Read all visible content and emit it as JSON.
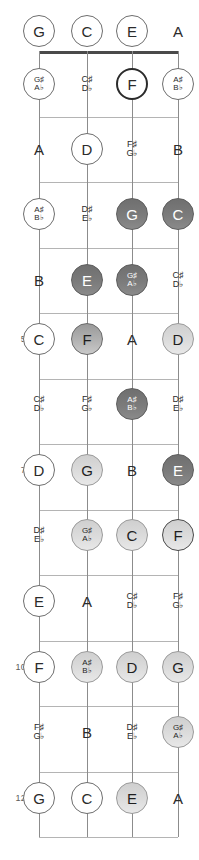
{
  "diagram": {
    "type": "bass-guitar-fretboard",
    "title": "",
    "orientation": "vertical",
    "string_count": 4,
    "fret_count": 12,
    "string_names": [
      "G",
      "C",
      "E",
      "A"
    ],
    "string_x": [
      39,
      87,
      132,
      178
    ],
    "nut_y": 51,
    "fret_spacing": 65.5,
    "fret_numbers_shown": [
      "5",
      "7",
      "10",
      "12"
    ],
    "colors": {
      "nut": "#4a4a4a",
      "fret_wire": "#b4b4b4",
      "string": "#8c8c8c",
      "ring_outline": "#6e6e6e",
      "fill_dark": "#7b7b7b",
      "fill_mid": "#b2b2b2",
      "fill_light": "#dcdcdc",
      "text_dark": "#2b2b2b",
      "text_light": "#ffffff",
      "fret_number": "#5a5a5a"
    }
  },
  "fret_labels": [
    {
      "fret": 5,
      "label": "5",
      "y": 339
    },
    {
      "fret": 7,
      "label": "7",
      "y": 470
    },
    {
      "fret": 10,
      "label": "10",
      "y": 667
    },
    {
      "fret": 12,
      "label": "12",
      "y": 798
    }
  ],
  "notes": [
    {
      "fret": 0,
      "string": 0,
      "x": 39,
      "y": 31,
      "natural": "G",
      "acc_top": "",
      "acc_bot": "",
      "style": "ring"
    },
    {
      "fret": 0,
      "string": 1,
      "x": 87,
      "y": 31,
      "natural": "C",
      "acc_top": "",
      "acc_bot": "",
      "style": "ring"
    },
    {
      "fret": 0,
      "string": 2,
      "x": 132,
      "y": 31,
      "natural": "E",
      "acc_top": "",
      "acc_bot": "",
      "style": "ring"
    },
    {
      "fret": 0,
      "string": 3,
      "x": 178,
      "y": 31,
      "natural": "A",
      "acc_top": "",
      "acc_bot": "",
      "style": "plain"
    },
    {
      "fret": 1,
      "string": 0,
      "x": 39,
      "y": 84,
      "natural": "",
      "acc_top": "G♯",
      "acc_bot": "A♭",
      "style": "ring"
    },
    {
      "fret": 1,
      "string": 1,
      "x": 87,
      "y": 84,
      "natural": "",
      "acc_top": "C♯",
      "acc_bot": "D♭",
      "style": "plain"
    },
    {
      "fret": 1,
      "string": 2,
      "x": 132,
      "y": 84,
      "natural": "F",
      "acc_top": "",
      "acc_bot": "",
      "style": "ring-thick"
    },
    {
      "fret": 1,
      "string": 3,
      "x": 178,
      "y": 84,
      "natural": "",
      "acc_top": "A♯",
      "acc_bot": "B♭",
      "style": "ring"
    },
    {
      "fret": 2,
      "string": 0,
      "x": 39,
      "y": 149,
      "natural": "A",
      "acc_top": "",
      "acc_bot": "",
      "style": "plain"
    },
    {
      "fret": 2,
      "string": 1,
      "x": 87,
      "y": 149,
      "natural": "D",
      "acc_top": "",
      "acc_bot": "",
      "style": "ring"
    },
    {
      "fret": 2,
      "string": 2,
      "x": 132,
      "y": 149,
      "natural": "",
      "acc_top": "F♯",
      "acc_bot": "G♭",
      "style": "plain"
    },
    {
      "fret": 2,
      "string": 3,
      "x": 178,
      "y": 149,
      "natural": "B",
      "acc_top": "",
      "acc_bot": "",
      "style": "plain"
    },
    {
      "fret": 3,
      "string": 0,
      "x": 39,
      "y": 214,
      "natural": "",
      "acc_top": "A♯",
      "acc_bot": "B♭",
      "style": "ring"
    },
    {
      "fret": 3,
      "string": 1,
      "x": 87,
      "y": 214,
      "natural": "",
      "acc_top": "D♯",
      "acc_bot": "E♭",
      "style": "plain"
    },
    {
      "fret": 3,
      "string": 2,
      "x": 132,
      "y": 214,
      "natural": "G",
      "acc_top": "",
      "acc_bot": "",
      "style": "fill-dark"
    },
    {
      "fret": 3,
      "string": 3,
      "x": 178,
      "y": 214,
      "natural": "C",
      "acc_top": "",
      "acc_bot": "",
      "style": "fill-dark"
    },
    {
      "fret": 4,
      "string": 0,
      "x": 39,
      "y": 280,
      "natural": "B",
      "acc_top": "",
      "acc_bot": "",
      "style": "plain"
    },
    {
      "fret": 4,
      "string": 1,
      "x": 87,
      "y": 280,
      "natural": "E",
      "acc_top": "",
      "acc_bot": "",
      "style": "fill-dark"
    },
    {
      "fret": 4,
      "string": 2,
      "x": 132,
      "y": 280,
      "natural": "",
      "acc_top": "G♯",
      "acc_bot": "A♭",
      "style": "fill-dark"
    },
    {
      "fret": 4,
      "string": 3,
      "x": 178,
      "y": 280,
      "natural": "",
      "acc_top": "C♯",
      "acc_bot": "D♭",
      "style": "plain"
    },
    {
      "fret": 5,
      "string": 0,
      "x": 39,
      "y": 339,
      "natural": "C",
      "acc_top": "",
      "acc_bot": "",
      "style": "ring"
    },
    {
      "fret": 5,
      "string": 1,
      "x": 87,
      "y": 339,
      "natural": "F",
      "acc_top": "",
      "acc_bot": "",
      "style": "fill-mid"
    },
    {
      "fret": 5,
      "string": 2,
      "x": 132,
      "y": 339,
      "natural": "A",
      "acc_top": "",
      "acc_bot": "",
      "style": "plain"
    },
    {
      "fret": 5,
      "string": 3,
      "x": 178,
      "y": 339,
      "natural": "D",
      "acc_top": "",
      "acc_bot": "",
      "style": "fill-light"
    },
    {
      "fret": 6,
      "string": 0,
      "x": 39,
      "y": 404,
      "natural": "",
      "acc_top": "C♯",
      "acc_bot": "D♭",
      "style": "plain"
    },
    {
      "fret": 6,
      "string": 1,
      "x": 87,
      "y": 404,
      "natural": "",
      "acc_top": "F♯",
      "acc_bot": "G♭",
      "style": "plain"
    },
    {
      "fret": 6,
      "string": 2,
      "x": 132,
      "y": 404,
      "natural": "",
      "acc_top": "A♯",
      "acc_bot": "B♭",
      "style": "fill-dark"
    },
    {
      "fret": 6,
      "string": 3,
      "x": 178,
      "y": 404,
      "natural": "",
      "acc_top": "D♯",
      "acc_bot": "E♭",
      "style": "plain"
    },
    {
      "fret": 7,
      "string": 0,
      "x": 39,
      "y": 470,
      "natural": "D",
      "acc_top": "",
      "acc_bot": "",
      "style": "ring"
    },
    {
      "fret": 7,
      "string": 1,
      "x": 87,
      "y": 470,
      "natural": "G",
      "acc_top": "",
      "acc_bot": "",
      "style": "fill-light"
    },
    {
      "fret": 7,
      "string": 2,
      "x": 132,
      "y": 470,
      "natural": "B",
      "acc_top": "",
      "acc_bot": "",
      "style": "plain"
    },
    {
      "fret": 7,
      "string": 3,
      "x": 178,
      "y": 470,
      "natural": "E",
      "acc_top": "",
      "acc_bot": "",
      "style": "fill-dark"
    },
    {
      "fret": 8,
      "string": 0,
      "x": 39,
      "y": 535,
      "natural": "",
      "acc_top": "D♯",
      "acc_bot": "E♭",
      "style": "plain"
    },
    {
      "fret": 8,
      "string": 1,
      "x": 87,
      "y": 535,
      "natural": "",
      "acc_top": "G♯",
      "acc_bot": "A♭",
      "style": "fill-light"
    },
    {
      "fret": 8,
      "string": 2,
      "x": 132,
      "y": 535,
      "natural": "C",
      "acc_top": "",
      "acc_bot": "",
      "style": "fill-light"
    },
    {
      "fret": 8,
      "string": 3,
      "x": 178,
      "y": 535,
      "natural": "F",
      "acc_top": "",
      "acc_bot": "",
      "style": "fill-light-ringed"
    },
    {
      "fret": 9,
      "string": 0,
      "x": 39,
      "y": 601,
      "natural": "E",
      "acc_top": "",
      "acc_bot": "",
      "style": "ring"
    },
    {
      "fret": 9,
      "string": 1,
      "x": 87,
      "y": 601,
      "natural": "A",
      "acc_top": "",
      "acc_bot": "",
      "style": "plain"
    },
    {
      "fret": 9,
      "string": 2,
      "x": 132,
      "y": 601,
      "natural": "",
      "acc_top": "C♯",
      "acc_bot": "D♭",
      "style": "plain"
    },
    {
      "fret": 9,
      "string": 3,
      "x": 178,
      "y": 601,
      "natural": "",
      "acc_top": "F♯",
      "acc_bot": "G♭",
      "style": "plain"
    },
    {
      "fret": 10,
      "string": 0,
      "x": 39,
      "y": 667,
      "natural": "F",
      "acc_top": "",
      "acc_bot": "",
      "style": "ring"
    },
    {
      "fret": 10,
      "string": 1,
      "x": 87,
      "y": 667,
      "natural": "",
      "acc_top": "A♯",
      "acc_bot": "B♭",
      "style": "fill-light"
    },
    {
      "fret": 10,
      "string": 2,
      "x": 132,
      "y": 667,
      "natural": "D",
      "acc_top": "",
      "acc_bot": "",
      "style": "fill-light"
    },
    {
      "fret": 10,
      "string": 3,
      "x": 178,
      "y": 667,
      "natural": "G",
      "acc_top": "",
      "acc_bot": "",
      "style": "fill-light"
    },
    {
      "fret": 11,
      "string": 0,
      "x": 39,
      "y": 732,
      "natural": "",
      "acc_top": "F♯",
      "acc_bot": "G♭",
      "style": "plain"
    },
    {
      "fret": 11,
      "string": 1,
      "x": 87,
      "y": 732,
      "natural": "B",
      "acc_top": "",
      "acc_bot": "",
      "style": "plain"
    },
    {
      "fret": 11,
      "string": 2,
      "x": 132,
      "y": 732,
      "natural": "",
      "acc_top": "D♯",
      "acc_bot": "E♭",
      "style": "plain"
    },
    {
      "fret": 11,
      "string": 3,
      "x": 178,
      "y": 732,
      "natural": "",
      "acc_top": "G♯",
      "acc_bot": "A♭",
      "style": "fill-light"
    },
    {
      "fret": 12,
      "string": 0,
      "x": 39,
      "y": 798,
      "natural": "G",
      "acc_top": "",
      "acc_bot": "",
      "style": "ring"
    },
    {
      "fret": 12,
      "string": 1,
      "x": 87,
      "y": 798,
      "natural": "C",
      "acc_top": "",
      "acc_bot": "",
      "style": "ring"
    },
    {
      "fret": 12,
      "string": 2,
      "x": 132,
      "y": 798,
      "natural": "E",
      "acc_top": "",
      "acc_bot": "",
      "style": "fill-light"
    },
    {
      "fret": 12,
      "string": 3,
      "x": 178,
      "y": 798,
      "natural": "A",
      "acc_top": "",
      "acc_bot": "",
      "style": "plain"
    }
  ]
}
